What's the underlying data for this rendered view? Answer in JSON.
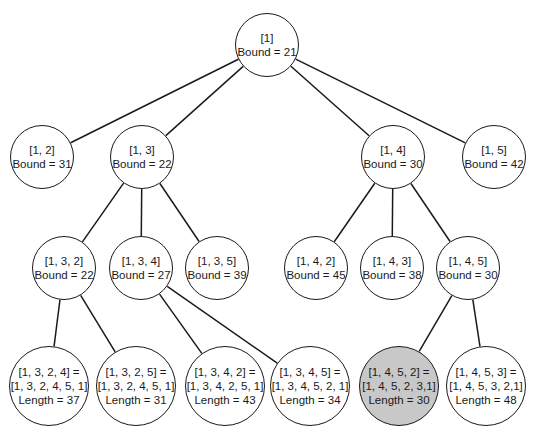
{
  "diagram": {
    "type": "branch-and-bound state space tree",
    "highlight_color": "#c8c8c8",
    "nodes": [
      {
        "id": "n1",
        "lines": [
          "[1]",
          "Bound = 21"
        ],
        "cx": 267,
        "cy": 45,
        "r": 32
      },
      {
        "id": "n12",
        "lines": [
          "[1, 2]",
          "Bound = 31"
        ],
        "cx": 42,
        "cy": 157,
        "r": 32
      },
      {
        "id": "n13",
        "lines": [
          "[1, 3]",
          "Bound = 22"
        ],
        "cx": 142,
        "cy": 157,
        "r": 32
      },
      {
        "id": "n14",
        "lines": [
          "[1, 4]",
          "Bound = 30"
        ],
        "cx": 393,
        "cy": 157,
        "r": 32
      },
      {
        "id": "n15",
        "lines": [
          "[1, 5]",
          "Bound = 42"
        ],
        "cx": 494,
        "cy": 157,
        "r": 32
      },
      {
        "id": "n132",
        "lines": [
          "[1, 3, 2]",
          "Bound = 22"
        ],
        "cx": 64,
        "cy": 268,
        "r": 32
      },
      {
        "id": "n134",
        "lines": [
          "[1, 3, 4]",
          "Bound = 27"
        ],
        "cx": 141,
        "cy": 268,
        "r": 32
      },
      {
        "id": "n135",
        "lines": [
          "[1, 3, 5]",
          "Bound = 39"
        ],
        "cx": 217,
        "cy": 268,
        "r": 32
      },
      {
        "id": "n142",
        "lines": [
          "[1, 4, 2]",
          "Bound = 45"
        ],
        "cx": 316,
        "cy": 268,
        "r": 32
      },
      {
        "id": "n143",
        "lines": [
          "[1, 4, 3]",
          "Bound = 38"
        ],
        "cx": 392,
        "cy": 268,
        "r": 32
      },
      {
        "id": "n145",
        "lines": [
          "[1, 4, 5]",
          "Bound = 30"
        ],
        "cx": 468,
        "cy": 268,
        "r": 32
      },
      {
        "id": "n1324",
        "lines": [
          "[1, 3, 2, 4] =",
          "[1, 3, 2, 4, 5, 1]",
          "Length = 37"
        ],
        "cx": 49,
        "cy": 386,
        "r": 40
      },
      {
        "id": "n1325",
        "lines": [
          "[1, 3, 2, 5] =",
          "[1, 3, 2, 4, 5, 1]",
          "Length = 31"
        ],
        "cx": 136,
        "cy": 386,
        "r": 40
      },
      {
        "id": "n1342",
        "lines": [
          "[1, 3, 4, 2] =",
          "[1, 3, 4, 2, 5, 1]",
          "Length = 43"
        ],
        "cx": 225,
        "cy": 386,
        "r": 40
      },
      {
        "id": "n1345",
        "lines": [
          "[1, 3, 4, 5] =",
          "[1, 3, 4, 5, 2, 1]",
          "Length = 34"
        ],
        "cx": 310,
        "cy": 386,
        "r": 40
      },
      {
        "id": "n1452",
        "lines": [
          "[1, 4, 5, 2] =",
          "[1, 4, 5, 2, 3,1]",
          "Length = 30"
        ],
        "cx": 399,
        "cy": 386,
        "r": 40,
        "shaded": true
      },
      {
        "id": "n1453",
        "lines": [
          "[1, 4, 5, 3] =",
          "[1, 4, 5, 3, 2,1]",
          "Length = 48"
        ],
        "cx": 486,
        "cy": 386,
        "r": 40
      }
    ],
    "edges": [
      [
        "n1",
        "n12"
      ],
      [
        "n1",
        "n13"
      ],
      [
        "n1",
        "n14"
      ],
      [
        "n1",
        "n15"
      ],
      [
        "n13",
        "n132"
      ],
      [
        "n13",
        "n134"
      ],
      [
        "n13",
        "n135"
      ],
      [
        "n14",
        "n142"
      ],
      [
        "n14",
        "n143"
      ],
      [
        "n14",
        "n145"
      ],
      [
        "n132",
        "n1324"
      ],
      [
        "n132",
        "n1325"
      ],
      [
        "n134",
        "n1342"
      ],
      [
        "n134",
        "n1345"
      ],
      [
        "n145",
        "n1452"
      ],
      [
        "n145",
        "n1453"
      ]
    ]
  }
}
